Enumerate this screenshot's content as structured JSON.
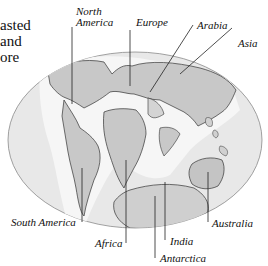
{
  "figure": {
    "top_cut_text": "",
    "caption_fragment": [
      "asted",
      "and",
      "ore"
    ],
    "labels": {
      "north_america": [
        "North",
        "America"
      ],
      "europe": "Europe",
      "arabia": "Arabia",
      "asia": "Asia",
      "south_america": "South America",
      "africa": "Africa",
      "india": "India",
      "antarctica": "Antarctica",
      "australia": "Australia"
    },
    "colors": {
      "ocean": "#e6e6e6",
      "land": "#c4c4c4",
      "shelf": "#f7f7f7",
      "outline": "#333333",
      "border": "#888888"
    }
  }
}
